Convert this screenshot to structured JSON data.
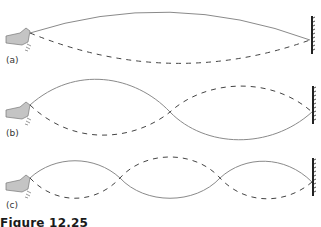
{
  "figure": {
    "caption": "Figure 12.25",
    "panels": [
      {
        "label": "(a)",
        "description": "fundamental mode"
      },
      {
        "label": "(b)",
        "description": "second harmonic"
      },
      {
        "label": "(c)",
        "description": "third harmonic"
      }
    ]
  },
  "colors": {
    "string": "#8a8a8a",
    "dashed": "#444444",
    "hand": "#bdbdbd",
    "wall": "#222222"
  }
}
